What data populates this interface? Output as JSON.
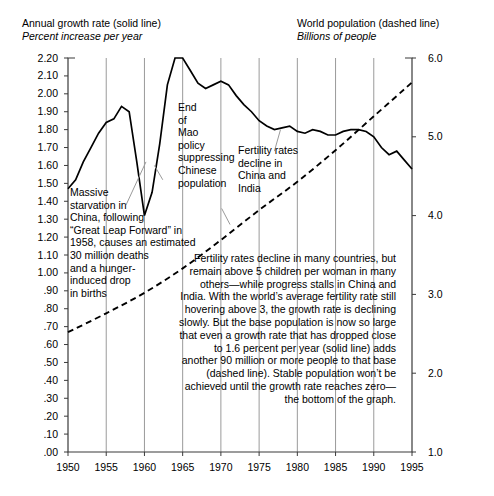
{
  "axis_captions": {
    "left": {
      "line1": "Annual growth rate (solid line)",
      "line2": "Percent increase per year"
    },
    "right": {
      "line1": "World population (dashed line)",
      "line2": "Billions of people"
    }
  },
  "annotations": {
    "starvation": "Massive\nstarvation in\nChina, following\n“Great Leap Forward” in\n1958, causes an estimated\n30 million deaths\nand a hunger-\ninduced drop\nin births",
    "mao": "End\nof\nMao\npolicy\nsuppressing\nChinese\npopulation",
    "fertility": "Fertility rates\ndecline in\nChina and\nIndia",
    "summary": "Fertility rates decline in many countries, but remain above 5 children per woman in many others—while progress stalls in China and India. With the world’s average fertility rate still hovering above 3, the growth rate is declining slowly. But the base population is now so large that even a growth rate that has dropped close to 1.6 percent per year (solid line) adds another 90 million or more people to that base (dashed line). Stable population won’t be achieved until the growth rate reaches zero—the bottom of the graph."
  },
  "colors": {
    "ink": "#000000",
    "grid": "#9a9a9a",
    "frame": "#3a3a3a"
  },
  "chart_data": {
    "type": "line",
    "title": "",
    "xlabel": "",
    "ylabel": "Percent increase per year",
    "y2label": "Billions of people",
    "grid": true,
    "legend": "inline-captions",
    "xlim": [
      1950,
      1995
    ],
    "ylim": [
      0.0,
      2.2
    ],
    "y2lim": [
      1.0,
      6.0
    ],
    "xticks": [
      1950,
      1955,
      1960,
      1965,
      1970,
      1975,
      1980,
      1985,
      1990,
      1995
    ],
    "xticklabels": [
      "1950",
      "1955",
      "1960",
      "1965",
      "1970",
      "1975",
      "1980",
      "1985",
      "1990",
      "1995"
    ],
    "yticks": [
      0.0,
      0.1,
      0.2,
      0.3,
      0.4,
      0.5,
      0.6,
      0.7,
      0.8,
      0.9,
      1.0,
      1.1,
      1.2,
      1.3,
      1.4,
      1.5,
      1.6,
      1.7,
      1.8,
      1.9,
      2.0,
      2.1,
      2.2
    ],
    "yticklabels": [
      ".00",
      ".10",
      ".20",
      ".30",
      ".40",
      ".50",
      ".60",
      ".70",
      ".80",
      ".90",
      "1.00",
      "1.10",
      "1.20",
      "1.30",
      "1.40",
      "1.50",
      "1.60",
      "1.70",
      "1.80",
      "1.90",
      "2.00",
      "2.10",
      "2.20"
    ],
    "y2ticks": [
      1.0,
      2.0,
      3.0,
      4.0,
      5.0,
      6.0
    ],
    "y2ticklabels": [
      "1.0",
      "2.0",
      "3.0",
      "4.0",
      "5.0",
      "6.0"
    ],
    "series": [
      {
        "name": "Annual growth rate (solid line)",
        "axis": "left",
        "style": "solid",
        "units": "percent per year",
        "x": [
          1950,
          1951,
          1952,
          1953,
          1954,
          1955,
          1956,
          1957,
          1958,
          1959,
          1960,
          1961,
          1962,
          1963,
          1964,
          1965,
          1966,
          1967,
          1968,
          1969,
          1970,
          1971,
          1972,
          1973,
          1974,
          1975,
          1976,
          1977,
          1978,
          1979,
          1980,
          1981,
          1982,
          1983,
          1984,
          1985,
          1986,
          1987,
          1988,
          1989,
          1990,
          1991,
          1992,
          1993,
          1994,
          1995
        ],
        "values": [
          1.47,
          1.52,
          1.62,
          1.7,
          1.78,
          1.84,
          1.86,
          1.93,
          1.9,
          1.62,
          1.32,
          1.45,
          1.72,
          2.05,
          2.2,
          2.2,
          2.13,
          2.06,
          2.03,
          2.05,
          2.07,
          2.05,
          1.99,
          1.94,
          1.9,
          1.85,
          1.82,
          1.8,
          1.81,
          1.82,
          1.79,
          1.78,
          1.8,
          1.79,
          1.77,
          1.77,
          1.79,
          1.8,
          1.8,
          1.79,
          1.76,
          1.7,
          1.66,
          1.68,
          1.63,
          1.58
        ]
      },
      {
        "name": "World population (dashed line)",
        "axis": "right",
        "style": "dashed",
        "units": "billions of people",
        "x": [
          1950,
          1955,
          1960,
          1965,
          1970,
          1975,
          1980,
          1985,
          1990,
          1995
        ],
        "values": [
          2.52,
          2.76,
          3.02,
          3.33,
          3.69,
          4.07,
          4.43,
          4.83,
          5.26,
          5.69
        ]
      }
    ],
    "annotations": [
      {
        "text": "Massive starvation in China, following “Great Leap Forward” in 1958, causes an estimated 30 million deaths and a hunger-induced drop in births",
        "points_to": {
          "x": 1960,
          "y": 1.32
        }
      },
      {
        "text": "End of Mao policy suppressing Chinese population",
        "points_to": {
          "x": 1963,
          "y": 1.72
        }
      },
      {
        "text": "Fertility rates decline in China and India",
        "points_to": {
          "x": 1978,
          "y": 1.81
        }
      },
      {
        "text": "Fertility rates decline in many countries, but remain above 5 children per woman in many others—while progress stalls in China and India. With the world’s average fertility rate still hovering above 3, the growth rate is declining slowly. But the base population is now so large that even a growth rate that has dropped close to 1.6 percent per year (solid line) adds another 90 million or more people to that base (dashed line). Stable population won’t be achieved until the growth rate reaches zero—the bottom of the graph.",
        "points_to": null
      }
    ]
  }
}
